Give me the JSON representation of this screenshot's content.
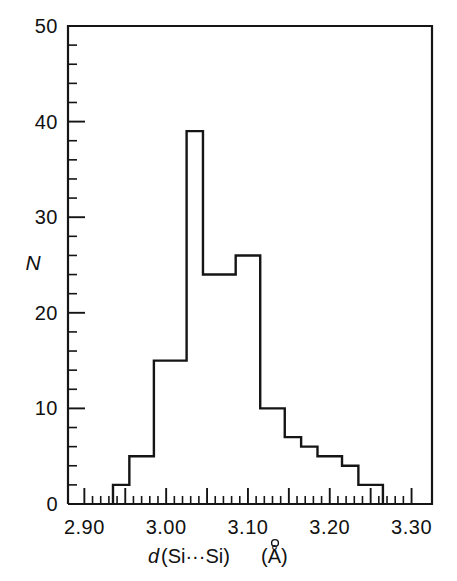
{
  "chart_data": {
    "type": "bar",
    "subtype": "histogram-step",
    "title": "",
    "xlabel": "d(Si···Si)  (Å)",
    "xlabel_parts": {
      "variable": "d",
      "open_paren": "(Si···Si)",
      "unit": "(Å)"
    },
    "ylabel": "N",
    "xlim": [
      2.88,
      3.325
    ],
    "ylim": [
      0,
      50
    ],
    "grid": false,
    "legend": null,
    "x_tick_labels": [
      "2.90",
      "3.00",
      "3.10",
      "3.20",
      "3.30"
    ],
    "x_tick_values": [
      2.9,
      3.0,
      3.1,
      3.2,
      3.3
    ],
    "x_major_tick_step": 0.05,
    "x_minor_tick_step": 0.01,
    "y_tick_labels": [
      "0",
      "10",
      "20",
      "30",
      "40",
      "50"
    ],
    "y_tick_values": [
      0,
      10,
      20,
      30,
      40,
      50
    ],
    "y_major_tick_step": 10,
    "y_minor_tick_step": 2,
    "bin_width": 0.01,
    "bin_edges": [
      2.935,
      2.945,
      2.955,
      2.965,
      2.975,
      2.985,
      2.995,
      3.005,
      3.015,
      3.025,
      3.035,
      3.045,
      3.055,
      3.065,
      3.075,
      3.085,
      3.095,
      3.105,
      3.115,
      3.125,
      3.135,
      3.145,
      3.155,
      3.165,
      3.175,
      3.185,
      3.195,
      3.205,
      3.215,
      3.225,
      3.235,
      3.245,
      3.255,
      3.265
    ],
    "values": [
      2,
      2,
      5,
      5,
      5,
      15,
      15,
      15,
      39,
      39,
      24,
      24,
      24,
      24,
      26,
      26,
      26,
      10,
      10,
      10,
      10,
      7,
      7,
      6,
      6,
      5,
      5,
      5,
      4,
      4,
      2,
      2,
      2
    ],
    "series": [
      {
        "name": "N",
        "values": [
          2,
          2,
          5,
          5,
          5,
          15,
          15,
          15,
          39,
          39,
          24,
          24,
          24,
          24,
          26,
          26,
          26,
          10,
          10,
          10,
          10,
          7,
          7,
          6,
          6,
          5,
          5,
          5,
          4,
          4,
          2,
          2,
          2
        ]
      }
    ],
    "step_outline": [
      {
        "x": 2.935,
        "y": 0
      },
      {
        "x": 2.935,
        "y": 2
      },
      {
        "x": 2.955,
        "y": 2
      },
      {
        "x": 2.955,
        "y": 5
      },
      {
        "x": 2.985,
        "y": 5
      },
      {
        "x": 2.985,
        "y": 15
      },
      {
        "x": 3.025,
        "y": 15
      },
      {
        "x": 3.025,
        "y": 39
      },
      {
        "x": 3.045,
        "y": 39
      },
      {
        "x": 3.045,
        "y": 24
      },
      {
        "x": 3.085,
        "y": 24
      },
      {
        "x": 3.085,
        "y": 26
      },
      {
        "x": 3.115,
        "y": 26
      },
      {
        "x": 3.115,
        "y": 10
      },
      {
        "x": 3.145,
        "y": 10
      },
      {
        "x": 3.145,
        "y": 7
      },
      {
        "x": 3.165,
        "y": 7
      },
      {
        "x": 3.165,
        "y": 6
      },
      {
        "x": 3.185,
        "y": 6
      },
      {
        "x": 3.185,
        "y": 5
      },
      {
        "x": 3.215,
        "y": 5
      },
      {
        "x": 3.215,
        "y": 4
      },
      {
        "x": 3.235,
        "y": 4
      },
      {
        "x": 3.235,
        "y": 2
      },
      {
        "x": 3.265,
        "y": 2
      },
      {
        "x": 3.265,
        "y": 0
      }
    ],
    "peak": {
      "value": 39,
      "x_center": 3.035
    },
    "secondary_peak": {
      "value": 26,
      "x_center": 3.1
    },
    "colors": {
      "line": "#151515",
      "frame": "#151515",
      "background": "#ffffff"
    }
  }
}
